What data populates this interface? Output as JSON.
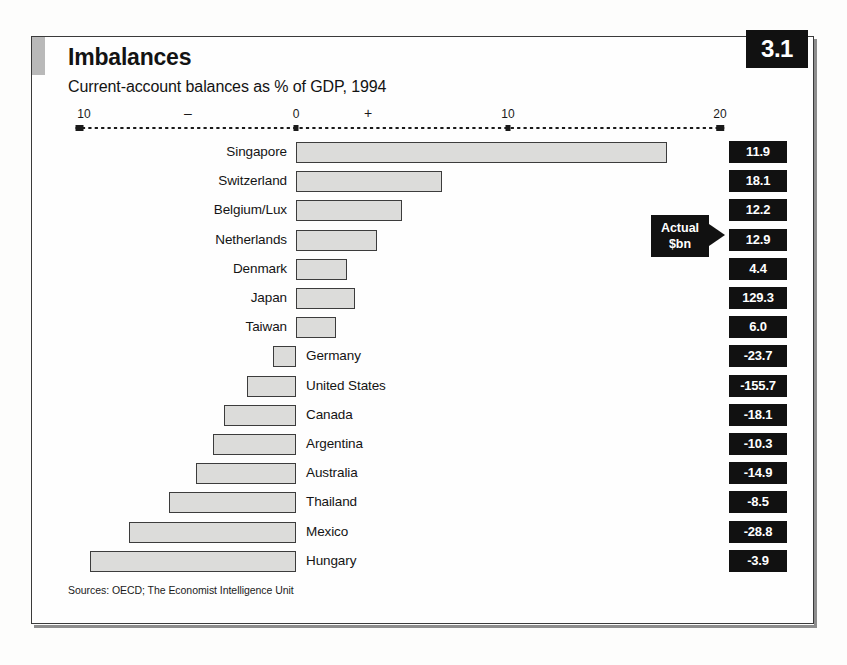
{
  "badge": {
    "number": "3.1"
  },
  "header": {
    "title": "Imbalances",
    "subtitle": "Current-account balances as % of GDP, 1994"
  },
  "annotation": {
    "line1": "Actual",
    "line2": "$bn"
  },
  "footer": {
    "source": "Sources: OECD; The Economist Intelligence Unit"
  },
  "axis": {
    "ticks": [
      {
        "label": "10",
        "value": -10
      },
      {
        "label": "0",
        "value": 0
      },
      {
        "label": "10",
        "value": 10
      },
      {
        "label": "20",
        "value": 20
      }
    ],
    "minus_sign": "–",
    "plus_sign": "+"
  },
  "chart_data": {
    "type": "bar",
    "orientation": "horizontal",
    "title": "Imbalances",
    "subtitle": "Current-account balances as % of GDP, 1994",
    "xlabel": "% of GDP",
    "ylabel": "",
    "xlim": [
      -10,
      20
    ],
    "grid": false,
    "legend": null,
    "value_column_header": "Actual $bn",
    "categories": [
      "Singapore",
      "Switzerland",
      "Belgium/Lux",
      "Netherlands",
      "Denmark",
      "Japan",
      "Taiwan",
      "Germany",
      "United States",
      "Canada",
      "Argentina",
      "Australia",
      "Thailand",
      "Mexico",
      "Hungary"
    ],
    "values": [
      17.5,
      6.9,
      5.0,
      3.8,
      2.4,
      2.8,
      1.9,
      -1.1,
      -2.3,
      -3.4,
      -3.9,
      -4.7,
      -6.0,
      -7.9,
      -9.7
    ],
    "annotations": [
      "11.9",
      "18.1",
      "12.2",
      "12.9",
      "4.4",
      "129.3",
      "6.0",
      "-23.7",
      "-155.7",
      "-18.1",
      "-10.3",
      "-14.9",
      "-8.5",
      "-28.8",
      "-3.9"
    ],
    "series": [
      {
        "name": "Current-account balance (% of GDP)",
        "points": [
          {
            "category": "Singapore",
            "value": 17.5,
            "actual_bn": "11.9"
          },
          {
            "category": "Switzerland",
            "value": 6.9,
            "actual_bn": "18.1"
          },
          {
            "category": "Belgium/Lux",
            "value": 5.0,
            "actual_bn": "12.2"
          },
          {
            "category": "Netherlands",
            "value": 3.8,
            "actual_bn": "12.9"
          },
          {
            "category": "Denmark",
            "value": 2.4,
            "actual_bn": "4.4"
          },
          {
            "category": "Japan",
            "value": 2.8,
            "actual_bn": "129.3"
          },
          {
            "category": "Taiwan",
            "value": 1.9,
            "actual_bn": "6.0"
          },
          {
            "category": "Germany",
            "value": -1.1,
            "actual_bn": "-23.7"
          },
          {
            "category": "United States",
            "value": -2.3,
            "actual_bn": "-155.7"
          },
          {
            "category": "Canada",
            "value": -3.4,
            "actual_bn": "-18.1"
          },
          {
            "category": "Argentina",
            "value": -3.9,
            "actual_bn": "-10.3"
          },
          {
            "category": "Australia",
            "value": -4.7,
            "actual_bn": "-14.9"
          },
          {
            "category": "Thailand",
            "value": -6.0,
            "actual_bn": "-8.5"
          },
          {
            "category": "Mexico",
            "value": -7.9,
            "actual_bn": "-28.8"
          },
          {
            "category": "Hungary",
            "value": -9.7,
            "actual_bn": "-3.9"
          }
        ]
      }
    ]
  },
  "colors": {
    "bar_fill": "#dcdcda",
    "bar_stroke": "#3c3c3c",
    "badge_bg": "#111111",
    "value_box_bg": "#111111",
    "frame": "#3a3a3a",
    "page_bg": "#fdfdfc"
  }
}
